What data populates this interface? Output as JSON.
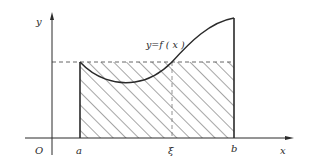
{
  "diagram": {
    "labels": {
      "y_axis": "y",
      "x_axis": "x",
      "origin": "O",
      "a": "a",
      "b": "b",
      "xi": "ξ",
      "curve": "y=f ( x )"
    },
    "colors": {
      "stroke": "#2a2a2a",
      "dashed": "#555555",
      "hatch": "#3a3a3a",
      "background": "#ffffff"
    },
    "elements": [
      "y-axis with arrow",
      "x-axis with arrow",
      "curve y=f(x) from a to b",
      "dashed horizontal line at f(ξ)",
      "dashed vertical line at ξ",
      "vertical boundary lines at a and b",
      "hatched rectangle from a to b with height f(ξ)"
    ]
  }
}
